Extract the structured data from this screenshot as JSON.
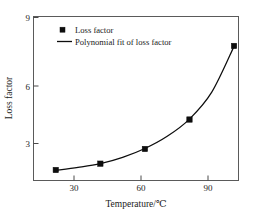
{
  "chart_data": {
    "type": "scatter",
    "title": "",
    "xlabel": "Temperature/℃",
    "ylabel": "Loss factor",
    "xlim": [
      10,
      102
    ],
    "ylim": [
      1.2,
      9.0
    ],
    "xticks": [
      30,
      60,
      90
    ],
    "xtick_labels": [
      "30",
      "60",
      "90"
    ],
    "yticks": [
      3,
      6,
      9
    ],
    "ytick_labels": [
      "3",
      "6",
      "9"
    ],
    "grid": false,
    "legend_position": "upper-left-inside",
    "series": [
      {
        "name": "Loss factor",
        "marker": "square",
        "color": "#0d0d0d",
        "x": [
          20,
          40,
          60,
          80,
          100
        ],
        "values": [
          1.7,
          2.0,
          2.7,
          4.1,
          7.6
        ]
      },
      {
        "name": "Polynomial fit of loss factor",
        "marker": "line",
        "color": "#0d0d0d",
        "x": [
          20,
          30,
          40,
          50,
          60,
          70,
          80,
          90,
          100
        ],
        "values": [
          1.68,
          1.82,
          2.0,
          2.3,
          2.72,
          3.3,
          4.12,
          5.4,
          7.58
        ]
      }
    ]
  },
  "legend": {
    "entries": [
      {
        "label": "Loss factor",
        "symbol": "square-marker"
      },
      {
        "label": "Polynomial fit of loss factor",
        "symbol": "line-segment"
      }
    ]
  },
  "axes": {
    "x_title": "Temperature/℃",
    "y_title": "Loss factor",
    "x_tick_labels": [
      "30",
      "60",
      "90"
    ],
    "y_tick_labels": [
      "3",
      "6",
      "9"
    ]
  }
}
